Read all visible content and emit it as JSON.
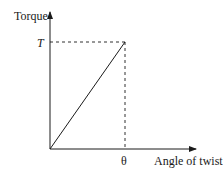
{
  "diagram": {
    "y_axis_label": "Torque",
    "x_axis_label": "Angle of twist",
    "y_tick_label": "T",
    "x_tick_label": "θ",
    "line": {
      "from": [
        0,
        0
      ],
      "to": [
        "θ",
        "T"
      ],
      "style": "solid"
    },
    "guides": [
      {
        "from": [
          "0",
          "T"
        ],
        "to": [
          "θ",
          "T"
        ],
        "style": "dashed"
      },
      {
        "from": [
          "θ",
          "0"
        ],
        "to": [
          "θ",
          "T"
        ],
        "style": "dashed"
      }
    ],
    "colors": {
      "ink": "#1a1a1a",
      "background": "#ffffff"
    }
  }
}
